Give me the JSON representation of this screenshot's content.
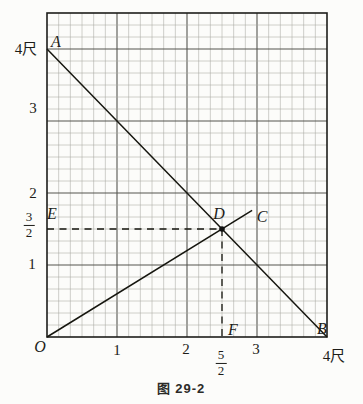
{
  "figure": {
    "caption": "图 29-2",
    "background": "#fcfcfa",
    "line_color": "#16160f",
    "grid_minor_color": "#a8a8a2",
    "grid_major_color": "#55554f",
    "border_color": "#1d1d1b"
  },
  "chart_data": {
    "type": "line",
    "title": "图 29-2",
    "xlim": [
      0,
      4
    ],
    "ylim": [
      0,
      4.5
    ],
    "x_unit": "尺",
    "y_unit": "尺",
    "grid": {
      "visible": true,
      "minor_divisions_per_unit": 6
    },
    "series": [
      {
        "name": "segment-AB",
        "style": "solid",
        "points": [
          [
            0,
            4
          ],
          [
            4,
            0
          ]
        ]
      },
      {
        "name": "segment-OC",
        "style": "solid",
        "points": [
          [
            0,
            0
          ],
          [
            2.93,
            1.76
          ]
        ]
      },
      {
        "name": "segment-ED",
        "style": "dashed",
        "points": [
          [
            0,
            1.5
          ],
          [
            2.5,
            1.5
          ]
        ]
      },
      {
        "name": "segment-DF",
        "style": "dashed",
        "points": [
          [
            2.5,
            1.5
          ],
          [
            2.5,
            0
          ]
        ]
      }
    ],
    "marked_points": [
      {
        "name": "D",
        "x": 2.5,
        "y": 1.5
      }
    ],
    "x_ticks": [
      {
        "label": "1",
        "value": 1
      },
      {
        "label": "2",
        "value": 2
      },
      {
        "label": "5/2",
        "value": 2.5,
        "fraction": true,
        "numerator": "5",
        "denominator": "2"
      },
      {
        "label": "3",
        "value": 3
      },
      {
        "label": "4尺",
        "value": 4
      }
    ],
    "y_ticks": [
      {
        "label": "4尺",
        "value": 4
      },
      {
        "label": "3",
        "value": 3
      },
      {
        "label": "2",
        "value": 2
      },
      {
        "label": "3/2",
        "value": 1.5,
        "fraction": true,
        "numerator": "3",
        "denominator": "2"
      },
      {
        "label": "1",
        "value": 1
      }
    ],
    "point_labels": [
      {
        "text": "A",
        "x": 0,
        "y": 4,
        "anchor": "above-right"
      },
      {
        "text": "B",
        "x": 4,
        "y": 0,
        "anchor": "above-left"
      },
      {
        "text": "C",
        "x": 2.93,
        "y": 1.76,
        "anchor": "right"
      },
      {
        "text": "D",
        "x": 2.5,
        "y": 1.5,
        "anchor": "above-left"
      },
      {
        "text": "E",
        "x": 0,
        "y": 1.5,
        "anchor": "above-right"
      },
      {
        "text": "F",
        "x": 2.5,
        "y": 0,
        "anchor": "above-right"
      },
      {
        "text": "O",
        "x": 0,
        "y": 0,
        "anchor": "below-left"
      }
    ]
  }
}
